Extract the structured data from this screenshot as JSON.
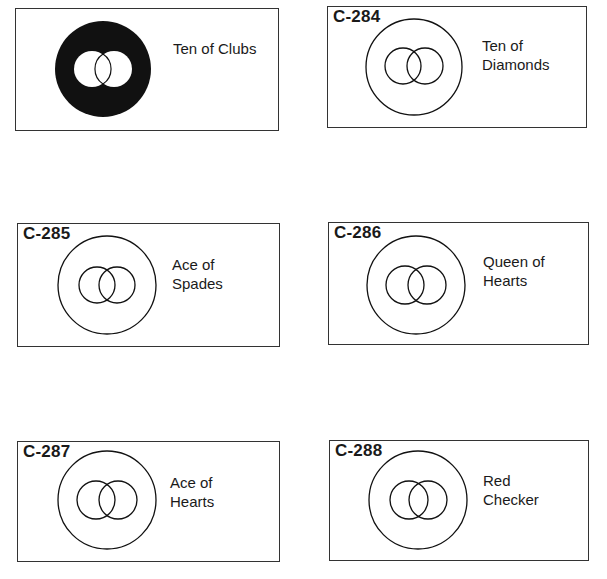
{
  "cards": [
    {
      "code": "",
      "label": "Ten of Clubs",
      "style": "filled"
    },
    {
      "code": "C-284",
      "label": "Ten of\nDiamonds",
      "style": "outline"
    },
    {
      "code": "C-285",
      "label": "Ace of\nSpades",
      "style": "outline"
    },
    {
      "code": "C-286",
      "label": "Queen of\nHearts",
      "style": "outline"
    },
    {
      "code": "C-287",
      "label": "Ace of\nHearts",
      "style": "outline"
    },
    {
      "code": "C-288",
      "label": "Red\nChecker",
      "style": "outline"
    }
  ],
  "colors": {
    "ink": "#111111",
    "border": "#333333",
    "background": "#ffffff"
  }
}
